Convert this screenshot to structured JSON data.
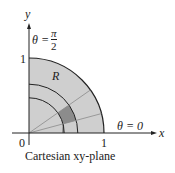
{
  "diagram": {
    "caption": "Cartesian xy-plane",
    "axis_x_label": "x",
    "axis_y_label": "y",
    "origin_label": "0",
    "x_tick_label": "1",
    "y_tick_label": "1",
    "region_label": "R",
    "theta_top": {
      "lhs": "θ =",
      "num": "π",
      "den": "2"
    },
    "theta_right": "θ = 0",
    "colors": {
      "region": "#cfcfcf",
      "sector": "#8c8c8c",
      "stroke": "#222222",
      "ray": "#8a8a8a"
    }
  }
}
